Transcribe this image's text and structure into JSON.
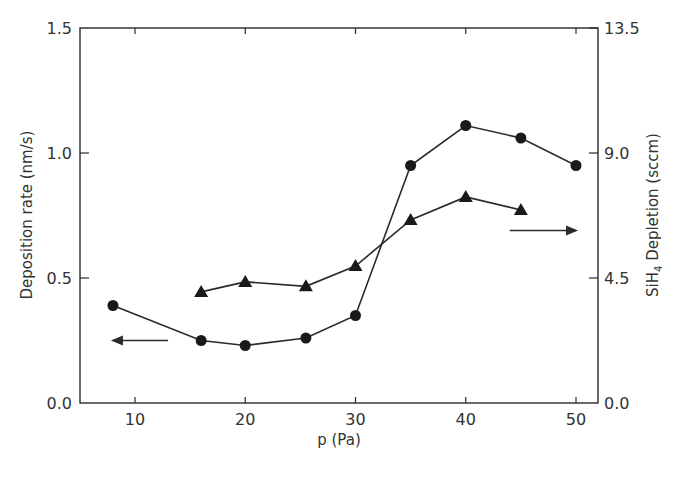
{
  "chart_data": {
    "type": "line",
    "title": "",
    "xlabel": "p (Pa)",
    "ylabel": "Deposition rate (nm/s)",
    "y2label": "SiH4 Depletion (sccm)",
    "y2label_parts": {
      "prefix": "SiH",
      "subscript": "4",
      "suffix": " Depletion (sccm)"
    },
    "xlim": [
      5,
      52
    ],
    "ylim": [
      0,
      1.5
    ],
    "y2lim": [
      0,
      13.5
    ],
    "x_ticks": [
      10,
      20,
      30,
      40,
      50
    ],
    "x_tick_labels": [
      "10",
      "20",
      "30",
      "40",
      "50"
    ],
    "y_ticks": [
      0,
      0.5,
      1.0,
      1.5
    ],
    "y_tick_labels": [
      "0.0",
      "0.5",
      "1.0",
      "1.5"
    ],
    "y2_ticks": [
      0,
      4.5,
      9.0,
      13.5
    ],
    "y2_tick_labels": [
      "0.0",
      "4.5",
      "9.0",
      "13.5"
    ],
    "grid": false,
    "legend": null,
    "series": [
      {
        "name": "Deposition rate",
        "axis": "left",
        "marker": "circle",
        "x": [
          8,
          16,
          20,
          25.5,
          30,
          35,
          40,
          45,
          50
        ],
        "values": [
          0.39,
          0.25,
          0.23,
          0.26,
          0.35,
          0.95,
          1.11,
          1.06,
          0.95
        ]
      },
      {
        "name": "SiH4 Depletion",
        "axis": "right",
        "marker": "triangle",
        "x": [
          16,
          20,
          25.5,
          30,
          35,
          40,
          45
        ],
        "values": [
          4.0,
          4.36,
          4.2,
          4.93,
          6.59,
          7.42,
          6.95
        ]
      }
    ],
    "annotations": [
      {
        "type": "arrow",
        "direction": "left",
        "meaning": "circles refer to left axis",
        "x_from": 13,
        "x_to": 8,
        "y_left": 0.25
      },
      {
        "type": "arrow",
        "direction": "right",
        "meaning": "triangles refer to right axis",
        "x_from": 44,
        "x_to": 50,
        "y_left": 0.69
      }
    ]
  }
}
